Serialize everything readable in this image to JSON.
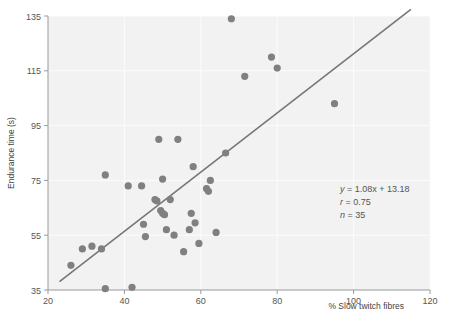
{
  "chart_data": {
    "type": "scatter",
    "title": "",
    "xlabel": "% Slow twitch fibres",
    "ylabel": "Endurance time (s)",
    "xlim": [
      20,
      120
    ],
    "ylim": [
      35,
      135
    ],
    "xticks": [
      20,
      40,
      60,
      80,
      100,
      120
    ],
    "yticks": [
      35,
      55,
      75,
      95,
      115,
      135
    ],
    "grid": true,
    "legend": "none",
    "marker_color": "#808080",
    "line_color": "#777777",
    "background": "#f2f2f2",
    "n_points": 35,
    "points": [
      {
        "x": 26.0,
        "y": 44.0
      },
      {
        "x": 29.0,
        "y": 50.0
      },
      {
        "x": 31.5,
        "y": 51.0
      },
      {
        "x": 34.0,
        "y": 50.0
      },
      {
        "x": 35.0,
        "y": 35.5
      },
      {
        "x": 35.0,
        "y": 77.0
      },
      {
        "x": 41.0,
        "y": 73.0
      },
      {
        "x": 42.0,
        "y": 36.0
      },
      {
        "x": 44.5,
        "y": 73.0
      },
      {
        "x": 45.0,
        "y": 59.0
      },
      {
        "x": 45.5,
        "y": 54.5
      },
      {
        "x": 48.0,
        "y": 68.0
      },
      {
        "x": 48.5,
        "y": 67.5
      },
      {
        "x": 49.0,
        "y": 90.0
      },
      {
        "x": 49.5,
        "y": 64.0
      },
      {
        "x": 50.0,
        "y": 63.0
      },
      {
        "x": 50.0,
        "y": 75.5
      },
      {
        "x": 50.5,
        "y": 62.5
      },
      {
        "x": 51.0,
        "y": 57.0
      },
      {
        "x": 52.0,
        "y": 68.0
      },
      {
        "x": 53.0,
        "y": 55.0
      },
      {
        "x": 54.0,
        "y": 90.0
      },
      {
        "x": 55.5,
        "y": 49.0
      },
      {
        "x": 57.0,
        "y": 57.0
      },
      {
        "x": 57.5,
        "y": 63.0
      },
      {
        "x": 58.0,
        "y": 80.0
      },
      {
        "x": 58.5,
        "y": 59.5
      },
      {
        "x": 59.5,
        "y": 52.0
      },
      {
        "x": 61.5,
        "y": 72.0
      },
      {
        "x": 62.0,
        "y": 71.0
      },
      {
        "x": 62.5,
        "y": 75.0
      },
      {
        "x": 64.0,
        "y": 56.0
      },
      {
        "x": 66.5,
        "y": 85.0
      },
      {
        "x": 68.0,
        "y": 134.0
      },
      {
        "x": 71.5,
        "y": 113.0
      },
      {
        "x": 78.5,
        "y": 120.0
      },
      {
        "x": 80.0,
        "y": 116.0
      },
      {
        "x": 95.0,
        "y": 103.0
      }
    ],
    "regression": {
      "equation": "y = 1.08x + 13.18",
      "slope": 1.08,
      "intercept": 13.18,
      "r": 0.75,
      "n": 35,
      "x_start": 23.0,
      "x_end": 115.0
    },
    "annotation": {
      "line1_var": "y",
      "line1_rest": " = 1.08x + 13.18",
      "line2_var": "r",
      "line2_rest": " = 0.75",
      "line3_var": "n",
      "line3_rest": " = 35"
    }
  }
}
